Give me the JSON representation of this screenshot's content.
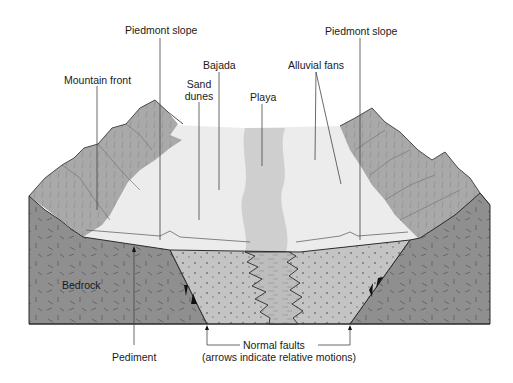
{
  "labels": {
    "piedmont_slope_left": "Piedmont slope",
    "piedmont_slope_right": "Piedmont slope",
    "mountain_front": "Mountain front",
    "bajada": "Bajada",
    "sand_dunes_line1": "Sand",
    "sand_dunes_line2": "dunes",
    "playa": "Playa",
    "alluvial_fans": "Alluvial fans",
    "bedrock": "Bedrock",
    "pediment": "Pediment",
    "normal_faults": "Normal faults",
    "normal_faults_note": "(arrows indicate relative motions)"
  },
  "colors": {
    "bedrock": "#8f8f8f",
    "basin_fill": "#c4c4c4",
    "playa_fill": "#bdbdbd",
    "playa_surface": "#cfcfcf",
    "bajada_surface": "#ececec",
    "mountain": "#a9a9a9",
    "mountain_light": "#c2c2c2",
    "outline": "#2b2b2b",
    "leader_line": "#444444"
  }
}
